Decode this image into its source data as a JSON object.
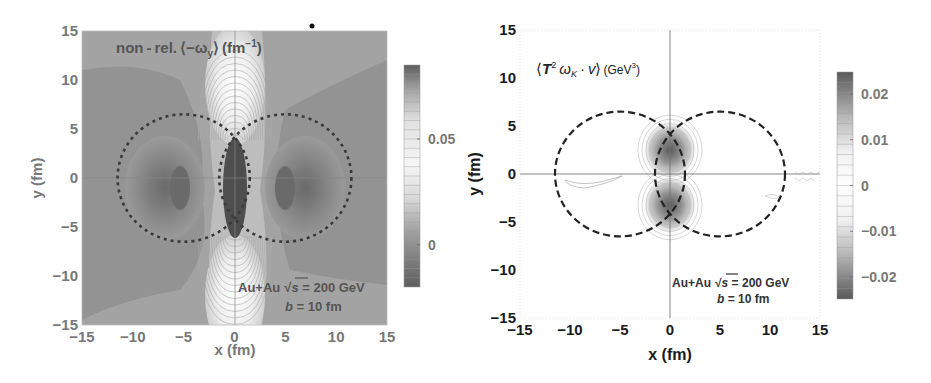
{
  "chart_data": [
    {
      "type": "heatmap",
      "subtype": "contour",
      "title": "non-rel. ⟨-ωy⟩ (fm⁻¹)",
      "title_parts": {
        "prefix": "non - rel. ⟨−ω",
        "sub": "y",
        "mid": "⟩ (fm",
        "sup": "−1",
        "suffix": ")"
      },
      "xlabel": "x (fm)",
      "ylabel": "y (fm)",
      "xlim": [
        -15,
        15
      ],
      "ylim": [
        -15,
        15
      ],
      "xticks": [
        -15,
        -10,
        -5,
        0,
        5,
        10,
        15
      ],
      "yticks": [
        -15,
        -10,
        -5,
        0,
        5,
        10,
        15
      ],
      "xtick_labels": [
        "−15",
        "−10",
        "−5",
        "0",
        "5",
        "10",
        "15"
      ],
      "ytick_labels": [
        "−15",
        "−10",
        "−5",
        "0",
        "5",
        "10",
        "15"
      ],
      "colorbar": {
        "ticks": [
          0.05,
          0
        ],
        "tick_labels": [
          "0.05",
          "0"
        ],
        "range": [
          -0.02,
          0.085
        ],
        "colormap": "grayscale (dark=high/low extremes, light=mid-high)"
      },
      "annotation": {
        "line1": "Au+Au",
        "sqrt_s": "s",
        "line1_rest": " = 200 GeV",
        "line2_var": "b",
        "line2_rest": " = 10 fm"
      },
      "nuclei_circles": [
        {
          "cx": -5,
          "cy": 0,
          "r": 6.5
        },
        {
          "cx": 5,
          "cy": 0,
          "r": 6.5
        }
      ],
      "features": [
        {
          "desc": "dark central almond (overlap region) minimum",
          "x": 0,
          "y": 0,
          "level": "low"
        },
        {
          "desc": "dark side lobes",
          "x": -5,
          "y": 0,
          "level": "low"
        },
        {
          "desc": "dark side lobes",
          "x": 5,
          "y": 0,
          "level": "low"
        },
        {
          "desc": "bright maximum above",
          "x": 0,
          "y": 6,
          "level": "high"
        },
        {
          "desc": "bright maximum below",
          "x": 0,
          "y": -6,
          "level": "high"
        }
      ],
      "grid": false
    },
    {
      "type": "heatmap",
      "subtype": "contour",
      "title": "⟨T² ωK · v⟩ (GeV³)",
      "title_parts": {
        "prefix": "⟨",
        "T": "T",
        "sup2": "2",
        "omega": " ω",
        "sub": "K",
        "dot": " · ",
        "v": "v",
        "close": "⟩",
        "unit": "(GeV",
        "sup3": "3",
        "unit_close": ")"
      },
      "xlabel": "x (fm)",
      "ylabel": "y (fm)",
      "xlim": [
        -15,
        15
      ],
      "ylim": [
        -15,
        15
      ],
      "xticks": [
        -15,
        -10,
        -5,
        0,
        5,
        10,
        15
      ],
      "yticks": [
        -15,
        -10,
        -5,
        0,
        5,
        10,
        15
      ],
      "xtick_labels": [
        "−15",
        "−10",
        "−5",
        "0",
        "5",
        "10",
        "15"
      ],
      "ytick_labels": [
        "−15",
        "−10",
        "−5",
        "0",
        "5",
        "10",
        "15"
      ],
      "colorbar": {
        "ticks": [
          0.02,
          0.01,
          0,
          -0.01,
          -0.02
        ],
        "tick_labels": [
          "0.02",
          "0.01",
          "0",
          "−0.01",
          "−0.02"
        ],
        "range": [
          -0.025,
          0.025
        ]
      },
      "annotation": {
        "line1": "Au+Au",
        "sqrt_s": "s",
        "line1_rest": " = 200 GeV",
        "line2_var": "b",
        "line2_rest": " = 10 fm"
      },
      "nuclei_circles": [
        {
          "cx": -5,
          "cy": 0,
          "r": 6.5
        },
        {
          "cx": 5,
          "cy": 0,
          "r": 6.5
        }
      ],
      "features": [
        {
          "desc": "dark lobe above center",
          "x": 0,
          "y": 2.5,
          "level": "high magnitude"
        },
        {
          "desc": "dark lobe below center",
          "x": 0,
          "y": -2.5,
          "level": "high magnitude"
        }
      ],
      "grid": false
    }
  ]
}
